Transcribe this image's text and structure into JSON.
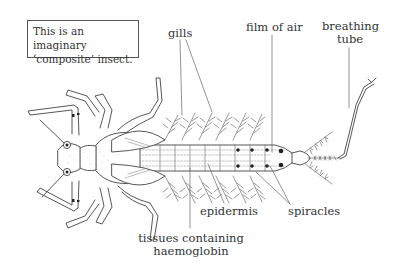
{
  "note": {
    "line1": "This is an imaginary",
    "line2": "‘composite’ insect."
  },
  "labels": {
    "gills": "gills",
    "film_of_air": "film of air",
    "breathing_tube_1": "breathing",
    "breathing_tube_2": "tube",
    "epidermis": "epidermis",
    "spiracles": "spiracles",
    "tissues_1": "tissues containing",
    "tissues_2": "haemoglobin"
  },
  "colors": {
    "line": "#444444",
    "text": "#333333",
    "background": "#ffffff"
  }
}
